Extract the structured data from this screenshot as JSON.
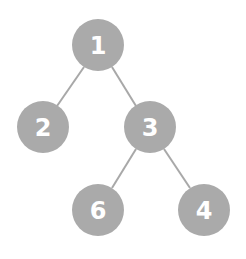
{
  "diagram": {
    "type": "binary-tree",
    "colors": {
      "node_fill": "#aaaaaa",
      "node_text": "#ffffff",
      "edge": "#a8a8a8",
      "background": "#ffffff"
    },
    "nodes": [
      {
        "id": "n1",
        "label": "1",
        "x": 98,
        "y": 45
      },
      {
        "id": "n2",
        "label": "2",
        "x": 43,
        "y": 127
      },
      {
        "id": "n3",
        "label": "3",
        "x": 150,
        "y": 127
      },
      {
        "id": "n6",
        "label": "6",
        "x": 98,
        "y": 210
      },
      {
        "id": "n4",
        "label": "4",
        "x": 204,
        "y": 210
      }
    ],
    "edges": [
      {
        "from": "1",
        "to": "2"
      },
      {
        "from": "1",
        "to": "3"
      },
      {
        "from": "3",
        "to": "6"
      },
      {
        "from": "3",
        "to": "4"
      }
    ]
  }
}
